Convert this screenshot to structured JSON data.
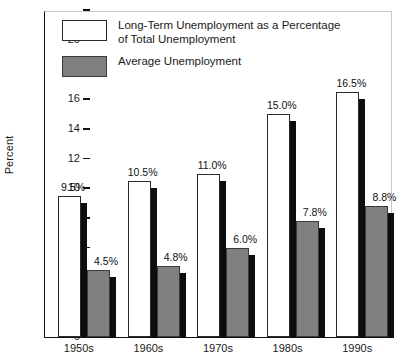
{
  "chart_data": {
    "type": "bar",
    "title": "",
    "xlabel": "",
    "ylabel": "Percent",
    "ylim": [
      0,
      22
    ],
    "ytick_values": [
      0,
      2,
      4,
      6,
      8,
      10,
      12,
      14,
      16,
      18,
      20,
      22
    ],
    "ytick_labels": [
      "0",
      "2",
      "4",
      "6",
      "8",
      "10",
      "12",
      "14",
      "16",
      "18",
      "20",
      ""
    ],
    "grid": false,
    "legend_position": "top-left",
    "categories": [
      "1950s",
      "1960s",
      "1970s",
      "1980s",
      "1990s"
    ],
    "series": [
      {
        "name": "Long-Term Unemployment as a Percentage of Total Unemployment",
        "color": "#ffffff",
        "values": [
          9.5,
          10.5,
          11.0,
          15.0,
          16.5
        ],
        "data_labels": [
          "9.5%",
          "10.5%",
          "11.0%",
          "15.0%",
          "16.5%"
        ]
      },
      {
        "name": "Average Unemployment",
        "color": "#808080",
        "values": [
          4.5,
          4.8,
          6.0,
          7.8,
          8.8
        ],
        "data_labels": [
          "4.5%",
          "4.8%",
          "6.0%",
          "7.8%",
          "8.8%"
        ]
      }
    ]
  },
  "legend": {
    "items": [
      {
        "label": "Long-Term Unemployment as a Percentage\nof Total Unemployment",
        "swatch": "light"
      },
      {
        "label": "Average Unemployment",
        "swatch": "dark"
      }
    ]
  },
  "axis": {
    "y_title": "Percent"
  }
}
